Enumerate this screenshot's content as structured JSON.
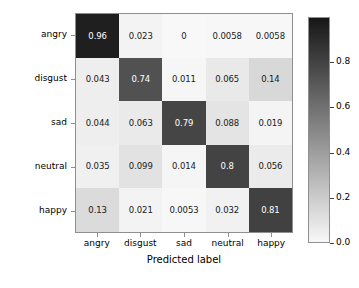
{
  "chart_data": {
    "type": "heatmap",
    "title": "",
    "xlabel": "Predicted label",
    "ylabel": "True label",
    "x_categories": [
      "angry",
      "disgust",
      "sad",
      "neutral",
      "happy"
    ],
    "y_categories": [
      "angry",
      "disgust",
      "sad",
      "neutral",
      "happy"
    ],
    "matrix": [
      [
        "0.96",
        "0.023",
        "0",
        "0.0058",
        "0.0058"
      ],
      [
        "0.043",
        "0.74",
        "0.011",
        "0.065",
        "0.14"
      ],
      [
        "0.044",
        "0.063",
        "0.79",
        "0.088",
        "0.019"
      ],
      [
        "0.035",
        "0.099",
        "0.014",
        "0.8",
        "0.056"
      ],
      [
        "0.13",
        "0.021",
        "0.0053",
        "0.032",
        "0.81"
      ]
    ],
    "values": [
      [
        0.96,
        0.023,
        0,
        0.0058,
        0.0058
      ],
      [
        0.043,
        0.74,
        0.011,
        0.065,
        0.14
      ],
      [
        0.044,
        0.063,
        0.79,
        0.088,
        0.019
      ],
      [
        0.035,
        0.099,
        0.014,
        0.8,
        0.056
      ],
      [
        0.13,
        0.021,
        0.0053,
        0.032,
        0.81
      ]
    ],
    "colormap": "gray_r",
    "colorbar": {
      "ticks": [
        "0.0",
        "0.2",
        "0.4",
        "0.6",
        "0.8"
      ],
      "tick_values": [
        0.0,
        0.2,
        0.4,
        0.6,
        0.8
      ],
      "vmin": 0.0,
      "vmax": 1.0,
      "position": "right",
      "low_color": "#ffffff",
      "high_color": "#1a1a1a"
    },
    "grid": false,
    "legend": "none"
  }
}
